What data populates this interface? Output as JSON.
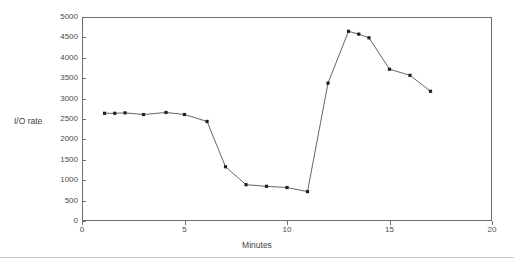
{
  "chart_data": {
    "type": "line",
    "title": "",
    "subtitle": "",
    "xlabel": "Minutes",
    "ylabel": "I/O rate",
    "xlim": [
      0,
      20
    ],
    "ylim": [
      0,
      5000
    ],
    "xticks": [
      0,
      5,
      10,
      15,
      20
    ],
    "xtick_labels": [
      "0",
      "5",
      "10",
      "15",
      "20"
    ],
    "yticks": [
      0,
      500,
      1000,
      1500,
      2000,
      2500,
      3000,
      3500,
      4000,
      4500,
      5000
    ],
    "ytick_labels": [
      "0",
      "500",
      "1000",
      "1500",
      "2000",
      "2500",
      "3000",
      "3500",
      "4000",
      "4500",
      "5000"
    ],
    "grid": false,
    "legend": false,
    "legend_position": "none",
    "marker": "square",
    "line_color": "#555555",
    "marker_color": "#222222",
    "frame_color": "#6f6f6f",
    "background_color": "#ffffff",
    "series": [
      {
        "name": "I/O rate",
        "x": [
          1.1,
          1.6,
          2.1,
          3.0,
          4.1,
          5.0,
          6.1,
          7.0,
          8.0,
          9.0,
          10.0,
          11.0,
          12.0,
          13.0,
          13.5,
          14.0,
          15.0,
          16.0,
          17.0
        ],
        "values": [
          2640,
          2640,
          2650,
          2610,
          2660,
          2610,
          2440,
          1330,
          890,
          850,
          820,
          720,
          3380,
          4650,
          4580,
          4490,
          3720,
          3570,
          3180
        ]
      }
    ]
  },
  "axis": {
    "y_title": "I/O rate",
    "x_title": "Minutes"
  }
}
